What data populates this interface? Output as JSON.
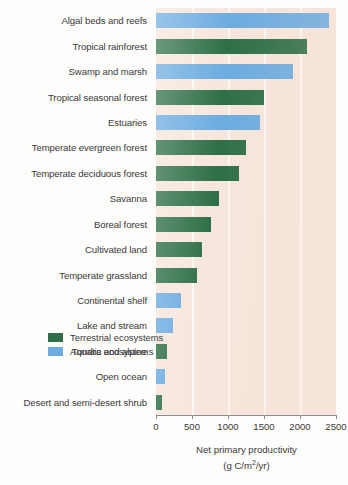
{
  "chart_data": {
    "type": "bar",
    "orientation": "horizontal",
    "title": "",
    "xlabel": "Net primary productivity (g C/m2/yr)",
    "ylabel": "",
    "xlim": [
      0,
      2500
    ],
    "xticks": [
      0,
      500,
      1000,
      1500,
      2000,
      2500
    ],
    "grid": true,
    "legend_position": "inside-bottom-right",
    "categories": [
      "Algal beds and reefs",
      "Tropical rainforest",
      "Swamp and marsh",
      "Tropical seasonal forest",
      "Estuaries",
      "Temperate evergreen forest",
      "Temperate deciduous forest",
      "Savanna",
      "Boreal forest",
      "Cultivated land",
      "Temperate grassland",
      "Continental shelf",
      "Lake and stream",
      "Tundra and alpine",
      "Open ocean",
      "Desert and semi-desert shrub"
    ],
    "values": [
      2400,
      2100,
      1900,
      1500,
      1450,
      1250,
      1150,
      880,
      770,
      640,
      570,
      350,
      240,
      150,
      130,
      90
    ],
    "groups": [
      "aquatic",
      "terrestrial",
      "aquatic",
      "terrestrial",
      "aquatic",
      "terrestrial",
      "terrestrial",
      "terrestrial",
      "terrestrial",
      "terrestrial",
      "terrestrial",
      "aquatic",
      "aquatic",
      "terrestrial",
      "aquatic",
      "terrestrial"
    ]
  },
  "axis": {
    "label_line1": "Net primary productivity",
    "label_line2_pre": "(g C/m",
    "label_line2_sup": "2",
    "label_line2_post": "/yr)",
    "tick_labels": [
      "0",
      "500",
      "1000",
      "1500",
      "2000",
      "2500"
    ]
  },
  "legend": {
    "items": [
      {
        "label": "Terrestrial ecosystems",
        "group": "terrestrial",
        "color": "#2e6f47"
      },
      {
        "label": "Aquatic ecosystems",
        "group": "aquatic",
        "color": "#6cace0"
      }
    ]
  },
  "colors": {
    "terrestrial": "#2e6f47",
    "aquatic": "#6cace0",
    "plot_background": "#f7e6dd",
    "gridline": "#fffcfa",
    "text": "#3a3a3a",
    "page_background": "#fdfdfb"
  }
}
